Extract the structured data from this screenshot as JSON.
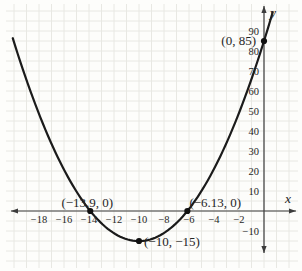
{
  "figure": {
    "background": "#fdfdfb",
    "grid_color": "#e8e8e3",
    "axis_color": "#3c3c3c",
    "curve_color": "#1b1b1b",
    "point_color": "#111111",
    "text_color": "#262626"
  },
  "chart_data": {
    "type": "line",
    "subtype": "quadratic-function-plot",
    "x_intercepts": [
      [
        -13.9,
        0
      ],
      [
        -6.13,
        0
      ]
    ],
    "vertex": [
      -10,
      -15
    ],
    "y_intercept": [
      0,
      85
    ],
    "labeled_points": [
      {
        "x": -13.9,
        "y": 0,
        "label": "(−13.9, 0)",
        "anchor": "middle",
        "dx": -3,
        "dy": -4
      },
      {
        "x": -6.13,
        "y": 0,
        "label": "(−6.13, 0)",
        "anchor": "start",
        "dx": 2,
        "dy": -4
      },
      {
        "x": -10,
        "y": -15,
        "label": "(−10, −15)",
        "anchor": "start",
        "dx": 5,
        "dy": 5
      },
      {
        "x": 0,
        "y": 85,
        "label": "(0, 85)",
        "anchor": "end",
        "dx": -8,
        "dy": 4
      }
    ],
    "x_ticks": [
      -18,
      -16,
      -14,
      -12,
      -10,
      -8,
      -6,
      -4,
      -2
    ],
    "y_ticks": [
      10,
      20,
      30,
      40,
      50,
      60,
      70,
      80,
      90
    ],
    "y_ticks_below": [
      -10
    ],
    "xlabel": "x",
    "ylabel": "y",
    "x_draw_range": [
      -20.1,
      0.84
    ],
    "xlim": [
      -20.3,
      2.6
    ],
    "ylim": [
      -22,
      102
    ],
    "grid": true,
    "x_minor_divisions_per_tick": 2,
    "y_minor_divisions_per_tick": 2,
    "legend": null,
    "title": ""
  }
}
